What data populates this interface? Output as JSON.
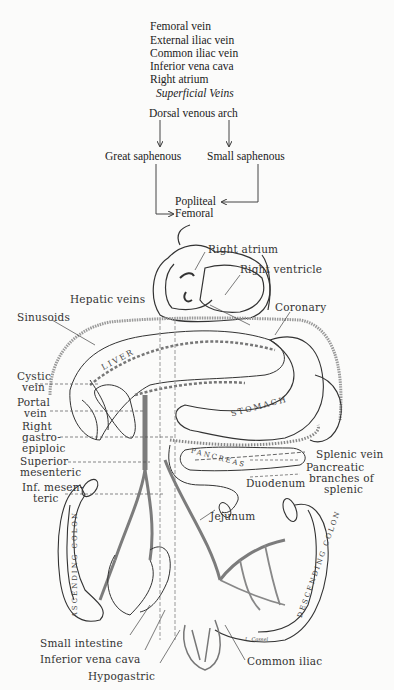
{
  "pathway_list": {
    "items": [
      "Femoral vein",
      "External iliac vein",
      "Common iliac vein",
      "Inferior vena cava",
      "Right atrium"
    ],
    "subtitle": "Superficial Veins"
  },
  "flowchart": {
    "top": "Dorsal venous arch",
    "left": "Great saphenous",
    "right": "Small saphenous",
    "merge_upper": "Popliteal",
    "merge_lower": "Femoral"
  },
  "illustration": {
    "labels": {
      "right_atrium": "Right atrium",
      "right_ventricle": "Right ventricle",
      "hepatic_veins": "Hepatic veins",
      "coronary": "Coronary",
      "sinusoids": "Sinusoids",
      "cystic_vein": [
        "Cystic",
        "vein"
      ],
      "portal_vein": [
        "Portal",
        "vein"
      ],
      "right_gastroepiploic": [
        "Right",
        "gastro-",
        "epiploic"
      ],
      "superior_mesenteric": [
        "Superior",
        "mesenteric"
      ],
      "inf_mesenteric": [
        "Inf. mesen-",
        "teric"
      ],
      "splenic_vein": "Splenic vein",
      "pancreatic_branches": [
        "Pancreatic",
        "branches of",
        "splenic"
      ],
      "duodenum": "Duodenum",
      "jejunum": "Jejunum",
      "small_intestine": "Small intestine",
      "inferior_vena_cava": "Inferior vena cava",
      "hypogastric": "Hypogastric",
      "common_iliac": "Common iliac"
    },
    "organs": {
      "liver": "LIVER",
      "stomach": "STOMACH",
      "pancreas": "PANCREAS",
      "ascending_colon": "ASCENDING COLON",
      "descending_colon": "DESCENDING COLON"
    },
    "signature": "L. Cassel"
  },
  "colors": {
    "ink": "#2a2a2a",
    "vein_gray": "#8a8a8a",
    "background": "#fbfbfa"
  }
}
